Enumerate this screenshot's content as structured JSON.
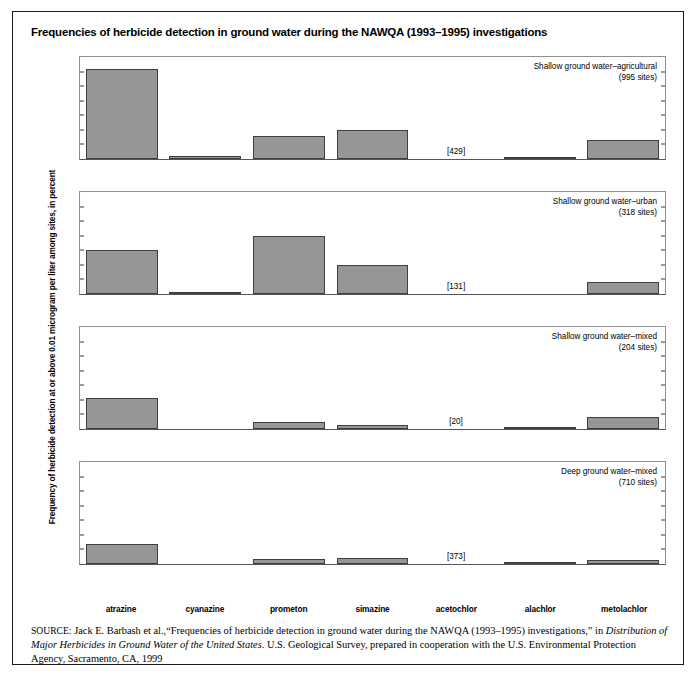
{
  "figure": {
    "title": "Frequencies of herbicide detection in ground water during the NAWQA (1993–1995) investigations",
    "top_cut_text": "TABLE 4.21",
    "y_axis_caption": "Frequency of herbicide detection at or above 0.01 microgram per liter among sites, in percent",
    "bar_color": "#969696",
    "bar_edge_color": "#3f3f3f"
  },
  "source": {
    "label": "SOURCE:",
    "text_1": " Jack E. Barbash et al.,“Frequencies of herbicide detection in ground water during the NAWQA (1993–1995) investigations,” in ",
    "italic_1": "Distribution of Major Herbicides in Ground Water of the United States",
    "text_2": ". U.S. Geological Survey, prepared in cooperation with the U.S. Environmental Protection Agency, Sacramento, CA, 1999"
  },
  "chart_data": {
    "type": "bar",
    "title": "Frequencies of herbicide detection in ground water during the NAWQA (1993–1995) investigations",
    "xlabel": "",
    "ylabel": "Frequency of herbicide detection at or above 0.01 microgram per liter among sites, in percent",
    "ylim": [
      0,
      35
    ],
    "yticks": [
      0,
      5,
      10,
      15,
      20,
      25,
      30,
      35
    ],
    "grid": false,
    "legend_position": "panel-top-right",
    "categories": [
      "atrazine",
      "cyanazine",
      "prometon",
      "simazine",
      "acetochlor",
      "alachlor",
      "metolachlor"
    ],
    "panels": [
      {
        "name": "Shallow ground water–agricultural",
        "sites_label": "(995 sites)",
        "values": [
          31,
          1.2,
          8,
          10,
          null,
          0.5,
          6.5
        ],
        "annotations": [
          null,
          null,
          null,
          null,
          "[429]",
          null,
          null
        ]
      },
      {
        "name": "Shallow ground water–urban",
        "sites_label": "(318 sites)",
        "values": [
          15,
          0.8,
          20,
          10,
          null,
          0,
          4
        ],
        "annotations": [
          null,
          null,
          null,
          null,
          "[131]",
          null,
          null
        ]
      },
      {
        "name": "Shallow ground water–mixed",
        "sites_label": "(204 sites)",
        "values": [
          10.5,
          0,
          2.5,
          1.5,
          null,
          0.5,
          4
        ],
        "annotations": [
          null,
          null,
          null,
          null,
          "[20]",
          null,
          null
        ]
      },
      {
        "name": "Deep ground water–mixed",
        "sites_label": "(710 sites)",
        "values": [
          7,
          0,
          1.8,
          2.2,
          null,
          0.8,
          1.5
        ],
        "annotations": [
          null,
          null,
          null,
          null,
          "[373]",
          null,
          null
        ]
      }
    ]
  }
}
